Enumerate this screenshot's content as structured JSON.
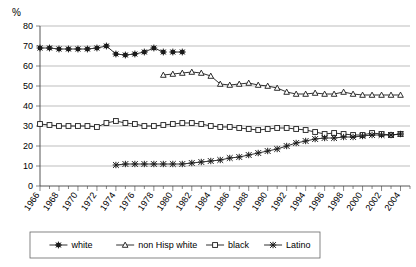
{
  "chart_data": {
    "type": "line",
    "title": "",
    "xlabel": "",
    "ylabel": "%",
    "ylim": [
      0,
      80
    ],
    "ytick_step": 10,
    "yticks": [
      "0",
      "10",
      "20",
      "30",
      "40",
      "50",
      "60",
      "70",
      "80"
    ],
    "xlim": [
      1966,
      2005
    ],
    "xtick_labels": [
      "1966",
      "1968",
      "1970",
      "1972",
      "1974",
      "1976",
      "1978",
      "1980",
      "1982",
      "1984",
      "1986",
      "1988",
      "1990",
      "1992",
      "1994",
      "1996",
      "1998",
      "2000",
      "2002",
      "2004"
    ],
    "xtick_step": 2,
    "minor_tick_step": 1,
    "grid": "horizontal",
    "legend_position": "bottom",
    "series": [
      {
        "name": "white",
        "marker": "asterisk",
        "x": [
          1966,
          1967,
          1968,
          1969,
          1970,
          1971,
          1972,
          1973,
          1974,
          1975,
          1976,
          1977,
          1978,
          1979
        ],
        "values": [
          69.0,
          69.0,
          68.5,
          68.5,
          68.5,
          68.5,
          69.0,
          70.0,
          66.0,
          65.5,
          66.0,
          67.0,
          69.0,
          67.0
        ]
      },
      {
        "name": "white-tail",
        "marker": "asterisk",
        "x": [
          1980,
          1981
        ],
        "values": [
          67.0,
          67.0
        ]
      },
      {
        "name": "non Hisp white",
        "marker": "triangle",
        "x": [
          1979,
          1980,
          1981,
          1982,
          1983,
          1984,
          1985,
          1986,
          1987,
          1988,
          1989,
          1990,
          1991,
          1992,
          1993,
          1994,
          1995,
          1996,
          1997,
          1998,
          1999,
          2000,
          2001,
          2002,
          2003,
          2004
        ],
        "values": [
          55.5,
          56.0,
          56.5,
          57.0,
          56.5,
          55.0,
          51.0,
          50.5,
          51.0,
          51.5,
          50.5,
          50.0,
          49.0,
          47.0,
          46.0,
          46.0,
          46.5,
          46.0,
          46.0,
          47.0,
          46.0,
          45.5,
          45.5,
          45.5,
          45.5,
          45.5
        ]
      },
      {
        "name": "black",
        "marker": "square",
        "x": [
          1966,
          1967,
          1968,
          1969,
          1970,
          1971,
          1972,
          1973,
          1974,
          1975,
          1976,
          1977,
          1978,
          1979,
          1980,
          1981,
          1982,
          1983,
          1984,
          1985,
          1986,
          1987,
          1988,
          1989,
          1990,
          1991,
          1992,
          1993,
          1994,
          1995,
          1996,
          1997,
          1998,
          1999,
          2000,
          2001,
          2002,
          2003,
          2004
        ],
        "values": [
          31.0,
          30.5,
          30.0,
          30.0,
          30.0,
          30.0,
          29.5,
          31.5,
          32.5,
          31.5,
          31.0,
          30.0,
          30.0,
          30.5,
          31.0,
          31.5,
          31.5,
          31.0,
          30.0,
          29.5,
          29.5,
          29.0,
          28.5,
          28.0,
          28.5,
          29.0,
          29.0,
          28.5,
          28.0,
          27.0,
          26.0,
          26.5,
          26.0,
          25.5,
          25.5,
          26.5,
          26.0,
          25.5,
          26.0
        ]
      },
      {
        "name": "Latino",
        "marker": "star",
        "x": [
          1974,
          1975,
          1976,
          1977,
          1978,
          1979,
          1980,
          1981,
          1982,
          1983,
          1984,
          1985,
          1986,
          1987,
          1988,
          1989,
          1990,
          1991,
          1992,
          1993,
          1994,
          1995,
          1996,
          1997,
          1998,
          1999,
          2000,
          2001,
          2002,
          2003,
          2004
        ],
        "values": [
          10.5,
          11.0,
          11.0,
          11.0,
          11.0,
          11.0,
          11.0,
          11.0,
          11.5,
          12.0,
          12.5,
          13.0,
          14.0,
          14.5,
          15.5,
          16.5,
          17.5,
          18.5,
          20.0,
          21.5,
          22.5,
          23.5,
          24.0,
          24.0,
          24.5,
          24.5,
          25.0,
          25.5,
          25.5,
          25.5,
          26.0
        ]
      }
    ],
    "legend": [
      {
        "label": "white",
        "marker": "asterisk"
      },
      {
        "label": "non Hisp white",
        "marker": "triangle"
      },
      {
        "label": "black",
        "marker": "square"
      },
      {
        "label": "Latino",
        "marker": "star"
      }
    ],
    "colors": {
      "line": "#1a1a1a",
      "grid": "#a0a0a0",
      "axis": "#444444",
      "background": "#ffffff"
    }
  }
}
